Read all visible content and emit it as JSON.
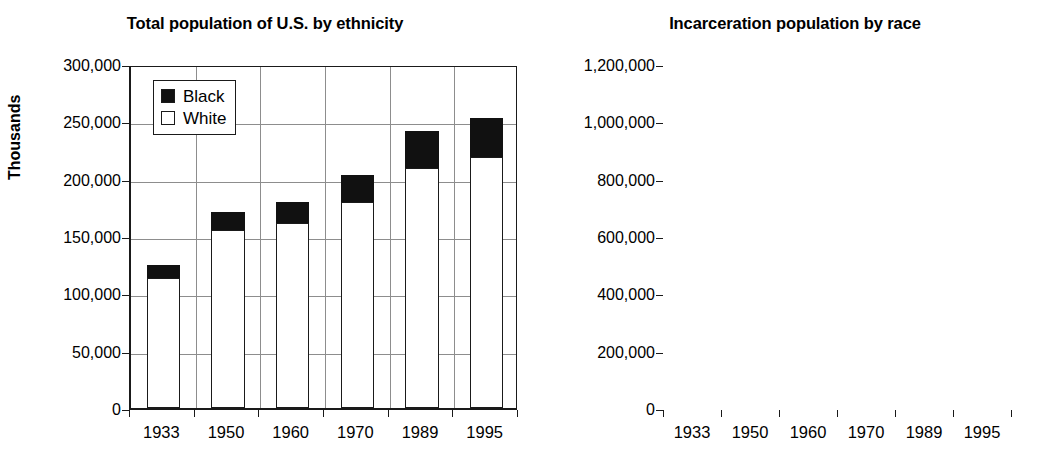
{
  "figure": {
    "panels": [
      {
        "id": "left",
        "title": "Total population of U.S. by ethnicity",
        "y_axis_title": "Thousands"
      },
      {
        "id": "right",
        "title": "Incarceration population by race"
      }
    ]
  },
  "chart_data": [
    {
      "type": "bar",
      "title": "Total population of U.S. by ethnicity",
      "xlabel": "",
      "ylabel": "Thousands",
      "ylim": [
        0,
        300000
      ],
      "ytick_labels": [
        "300,000",
        "250,000",
        "200,000",
        "150,000",
        "100,000",
        "50,000",
        "0"
      ],
      "ytick_values": [
        300000,
        250000,
        200000,
        150000,
        100000,
        50000,
        0
      ],
      "grid": true,
      "stacked": true,
      "legend": [
        "Black",
        "White"
      ],
      "legend_position": "upper left inside",
      "categories": [
        "1933",
        "1950",
        "1960",
        "1970",
        "1989",
        "1995"
      ],
      "series": [
        {
          "name": "White",
          "values": [
            113000,
            155000,
            161000,
            180000,
            209000,
            219000
          ]
        },
        {
          "name": "Black",
          "values": [
            12000,
            16000,
            19000,
            23000,
            33000,
            34000
          ]
        }
      ],
      "totals": [
        125000,
        171000,
        180000,
        203000,
        242000,
        253000
      ]
    },
    {
      "type": "area",
      "title": "Incarceration population by race",
      "xlabel": "",
      "ylabel": "",
      "ylim": [
        0,
        1200000
      ],
      "ytick_labels": [
        "1,200,000",
        "1,000,000",
        "800,000",
        "600,000",
        "400,000",
        "200,000",
        "0"
      ],
      "ytick_values": [
        1200000,
        1000000,
        800000,
        600000,
        400000,
        200000,
        0
      ],
      "grid": true,
      "categories": [
        "1933",
        "1950",
        "1960",
        "1970",
        "1989",
        "1995"
      ],
      "series": [
        {
          "name": "upper band (total)",
          "values": [
            140000,
            175000,
            218000,
            202000,
            680000,
            1000000
          ]
        },
        {
          "name": "lower band",
          "values": [
            110000,
            130000,
            150000,
            128000,
            350000,
            465000
          ]
        }
      ],
      "band_fill_color": "#111111"
    }
  ],
  "legend": {
    "items": [
      {
        "label": "Black",
        "swatch": "filled-black"
      },
      {
        "label": "White",
        "swatch": "outline-white"
      }
    ]
  },
  "colors": {
    "ink": "#111111",
    "grid": "#8d8d8d",
    "axis": "#1a1a1a",
    "background": "#ffffff"
  }
}
